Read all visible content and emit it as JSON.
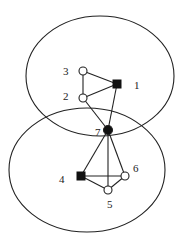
{
  "diagram": {
    "type": "graph-with-overlapping-clusters",
    "colors": {
      "stroke": "#222222",
      "background": "#ffffff",
      "filled": "#111111"
    },
    "clusters": [
      {
        "id": "top-cluster",
        "cx": 100,
        "cy": 76,
        "rx": 74,
        "ry": 60
      },
      {
        "id": "bottom-cluster",
        "cx": 87,
        "cy": 170,
        "rx": 78,
        "ry": 62
      }
    ],
    "nodes": [
      {
        "id": "1",
        "label": "1",
        "shape": "square",
        "filled": true,
        "x": 117,
        "y": 84,
        "label_x": 134,
        "label_y": 89
      },
      {
        "id": "2",
        "label": "2",
        "shape": "circle",
        "filled": false,
        "x": 83,
        "y": 98,
        "label_x": 63,
        "label_y": 100
      },
      {
        "id": "3",
        "label": "3",
        "shape": "circle",
        "filled": false,
        "x": 83,
        "y": 71,
        "label_x": 63,
        "label_y": 75
      },
      {
        "id": "4",
        "label": "4",
        "shape": "square",
        "filled": true,
        "x": 81,
        "y": 176,
        "label_x": 59,
        "label_y": 183
      },
      {
        "id": "5",
        "label": "5",
        "shape": "circle",
        "filled": false,
        "x": 108,
        "y": 190,
        "label_x": 107,
        "label_y": 208
      },
      {
        "id": "6",
        "label": "6",
        "shape": "circle",
        "filled": false,
        "x": 125,
        "y": 176,
        "label_x": 133,
        "label_y": 172
      },
      {
        "id": "7",
        "label": "7",
        "shape": "circle",
        "filled": true,
        "x": 108,
        "y": 130,
        "label_x": 95,
        "label_y": 136
      }
    ],
    "edges": [
      [
        "3",
        "1"
      ],
      [
        "2",
        "1"
      ],
      [
        "3",
        "2"
      ],
      [
        "2",
        "7"
      ],
      [
        "1",
        "7"
      ],
      [
        "7",
        "4"
      ],
      [
        "7",
        "5"
      ],
      [
        "7",
        "6"
      ],
      [
        "4",
        "6"
      ],
      [
        "4",
        "5"
      ],
      [
        "5",
        "6"
      ]
    ]
  }
}
